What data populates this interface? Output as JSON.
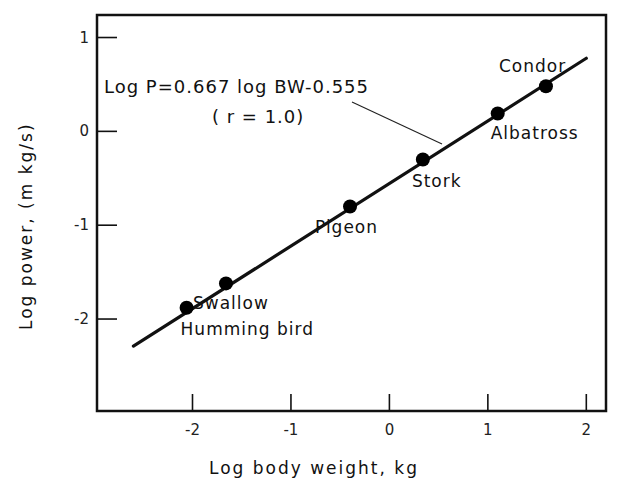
{
  "chart_data": {
    "type": "scatter",
    "title": "",
    "xlabel": "Log body weight,  kg",
    "ylabel": "Log power,   (m kg/s)",
    "xlim": [
      -2.97,
      2.2
    ],
    "ylim": [
      -2.98,
      1.24
    ],
    "x_ticks": [
      -2,
      -1,
      0,
      1,
      2
    ],
    "x_tick_labels": [
      "-2",
      "-1",
      "0",
      "1",
      "2"
    ],
    "y_ticks": [
      1,
      0,
      -1,
      -2
    ],
    "y_tick_labels": [
      "1",
      "0",
      "-1",
      "-2"
    ],
    "grid": false,
    "legend": null,
    "series": [
      {
        "name": "Birds",
        "points": [
          {
            "label": "Humming bird",
            "x": -2.06,
            "y": -1.88
          },
          {
            "label": "Swallow",
            "x": -1.66,
            "y": -1.62
          },
          {
            "label": "Pigeon",
            "x": -0.4,
            "y": -0.8
          },
          {
            "label": "Stork",
            "x": 0.34,
            "y": -0.3
          },
          {
            "label": "Albatross",
            "x": 1.1,
            "y": 0.19
          },
          {
            "label": "Condor",
            "x": 1.59,
            "y": 0.48
          }
        ]
      }
    ],
    "fit_line": {
      "slope": 0.667,
      "intercept": -0.555,
      "x_range": [
        -2.6,
        2.0
      ]
    },
    "annotations": [
      {
        "text": "Log  P=0.667 log BW-0.555",
        "role": "equation"
      },
      {
        "text": "( r = 1.0)",
        "role": "correlation"
      }
    ]
  },
  "labels": {
    "equation": "Log  P=0.667 log BW-0.555",
    "correlation": "( r = 1.0)",
    "xlabel": "Log body weight,  kg",
    "ylabel": "Log power,   (m kg/s)"
  }
}
